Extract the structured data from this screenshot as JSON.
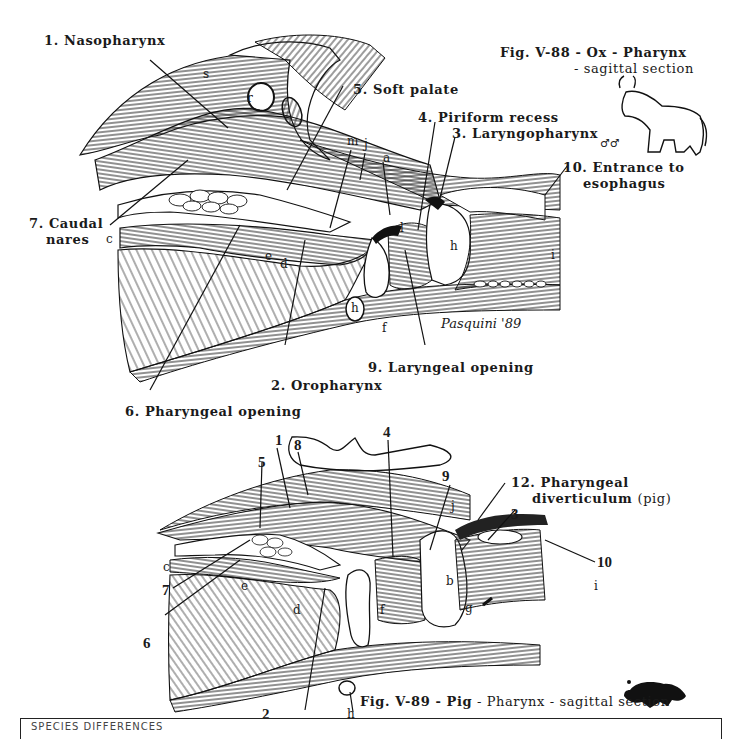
{
  "figure_top": {
    "caption_line1": "Fig. V-88 - Ox - Pharynx",
    "caption_line2": "- sagittal section",
    "species_icon": "ox-icon",
    "sex_symbols": "♂♂",
    "signature": "Pasquini '89",
    "labels": {
      "nasopharynx": "1. Nasopharynx",
      "oropharynx": "2. Oropharynx",
      "laryngopharynx": "3. Laryngopharynx",
      "piriform_recess": "4. Piriform recess",
      "soft_palate": "5. Soft palate",
      "pharyngeal_opening": "6. Pharyngeal opening",
      "caudal_nares_1": "7. Caudal",
      "caudal_nares_2": "nares",
      "laryngeal_opening": "9. Laryngeal opening",
      "esophagus_1": "10. Entrance to",
      "esophagus_2": "esophagus"
    },
    "letters": {
      "s": "s",
      "r": "r",
      "m": "m",
      "j": "j",
      "a": "a",
      "c": "c",
      "e": "e",
      "d": "d",
      "f": "f",
      "h1": "h",
      "h2": "h",
      "i": "i",
      "l": "l"
    }
  },
  "figure_bottom": {
    "caption_fig": "Fig. V-89 - ",
    "caption_species": "Pig",
    "caption_rest": " - Pharynx - sagittal section",
    "species_icon": "pig-icon",
    "labels": {
      "n1": "1",
      "n2": "2",
      "n3": "3",
      "n4": "4",
      "n5": "5",
      "n6": "6",
      "n7": "7",
      "n8": "8",
      "n9": "9",
      "n10": "10",
      "diverticulum_1": "12. Pharyngeal",
      "diverticulum_2": "diverticulum",
      "diverticulum_3": "(pig)"
    },
    "letters": {
      "c": "c",
      "e": "e",
      "d": "d",
      "f": "f",
      "b": "b",
      "g": "g",
      "h": "h",
      "i": "i",
      "j": "j",
      "l": "l"
    }
  },
  "footer_box": {
    "heading": "SPECIES DIFFERENCES"
  }
}
